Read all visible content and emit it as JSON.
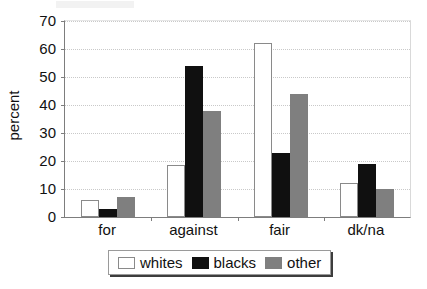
{
  "chart_data": {
    "type": "bar",
    "title": "",
    "subtitle": "",
    "xlabel": "",
    "ylabel": "percent",
    "categories": [
      "for",
      "against",
      "fair",
      "dk/na"
    ],
    "series": [
      {
        "name": "whites",
        "color": "#ffffff",
        "values": [
          6,
          18.5,
          62,
          12
        ]
      },
      {
        "name": "blacks",
        "color": "#101010",
        "values": [
          3,
          54,
          23,
          19
        ]
      },
      {
        "name": "other",
        "color": "#7f7f7f",
        "values": [
          7,
          38,
          44,
          10
        ]
      }
    ],
    "ylim": [
      0,
      70
    ],
    "yticks": [
      0,
      10,
      20,
      30,
      40,
      50,
      60,
      70
    ],
    "ytick_labels": [
      "0",
      "10",
      "20",
      "30",
      "40",
      "50",
      "60",
      "70"
    ],
    "grid": true,
    "grid_axis": "y",
    "grid_style": "dotted",
    "legend_position": "bottom"
  },
  "legend": {
    "entries": [
      {
        "label": "whites"
      },
      {
        "label": "blacks"
      },
      {
        "label": "other"
      }
    ]
  },
  "axes": {
    "y_title": "percent"
  }
}
